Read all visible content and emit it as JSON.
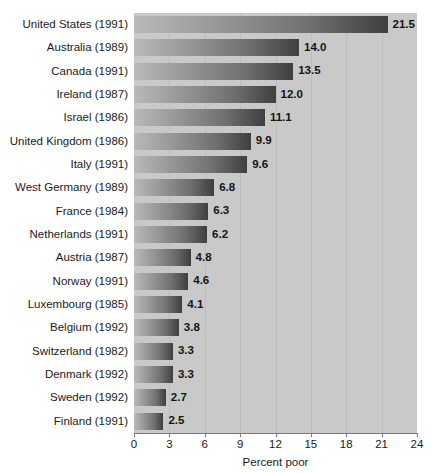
{
  "chart_data": {
    "type": "bar",
    "orientation": "horizontal",
    "title": "",
    "xlabel": "Percent poor",
    "ylabel": "",
    "xlim": [
      0,
      24
    ],
    "xticks": [
      0,
      3,
      6,
      9,
      12,
      15,
      18,
      21,
      24
    ],
    "grid": true,
    "legend": false,
    "categories": [
      "United States (1991)",
      "Australia (1989)",
      "Canada (1991)",
      "Ireland (1987)",
      "Israel (1986)",
      "United Kingdom (1986)",
      "Italy (1991)",
      "West Germany (1989)",
      "France (1984)",
      "Netherlands (1991)",
      "Austria (1987)",
      "Norway (1991)",
      "Luxembourg (1985)",
      "Belgium (1992)",
      "Switzerland (1982)",
      "Denmark (1992)",
      "Sweden (1992)",
      "Finland (1991)"
    ],
    "values": [
      21.5,
      14.0,
      13.5,
      12.0,
      11.1,
      9.9,
      9.6,
      6.8,
      6.3,
      6.2,
      4.8,
      4.6,
      4.1,
      3.8,
      3.3,
      3.3,
      2.7,
      2.5
    ],
    "value_labels": [
      "21.5",
      "14.0",
      "13.5",
      "12.0",
      "11.1",
      "9.9",
      "9.6",
      "6.8",
      "6.3",
      "6.2",
      "4.8",
      "4.6",
      "4.1",
      "3.8",
      "3.3",
      "3.3",
      "2.7",
      "2.5"
    ],
    "colors": {
      "plot_background": "#c9c9c9",
      "gridline": "#bdbdbd",
      "bar_gradient_start": "#b9b9b9",
      "bar_gradient_end": "#3f3f3f",
      "axis": "#7a7a7a",
      "text": "#1b1b1b"
    }
  }
}
